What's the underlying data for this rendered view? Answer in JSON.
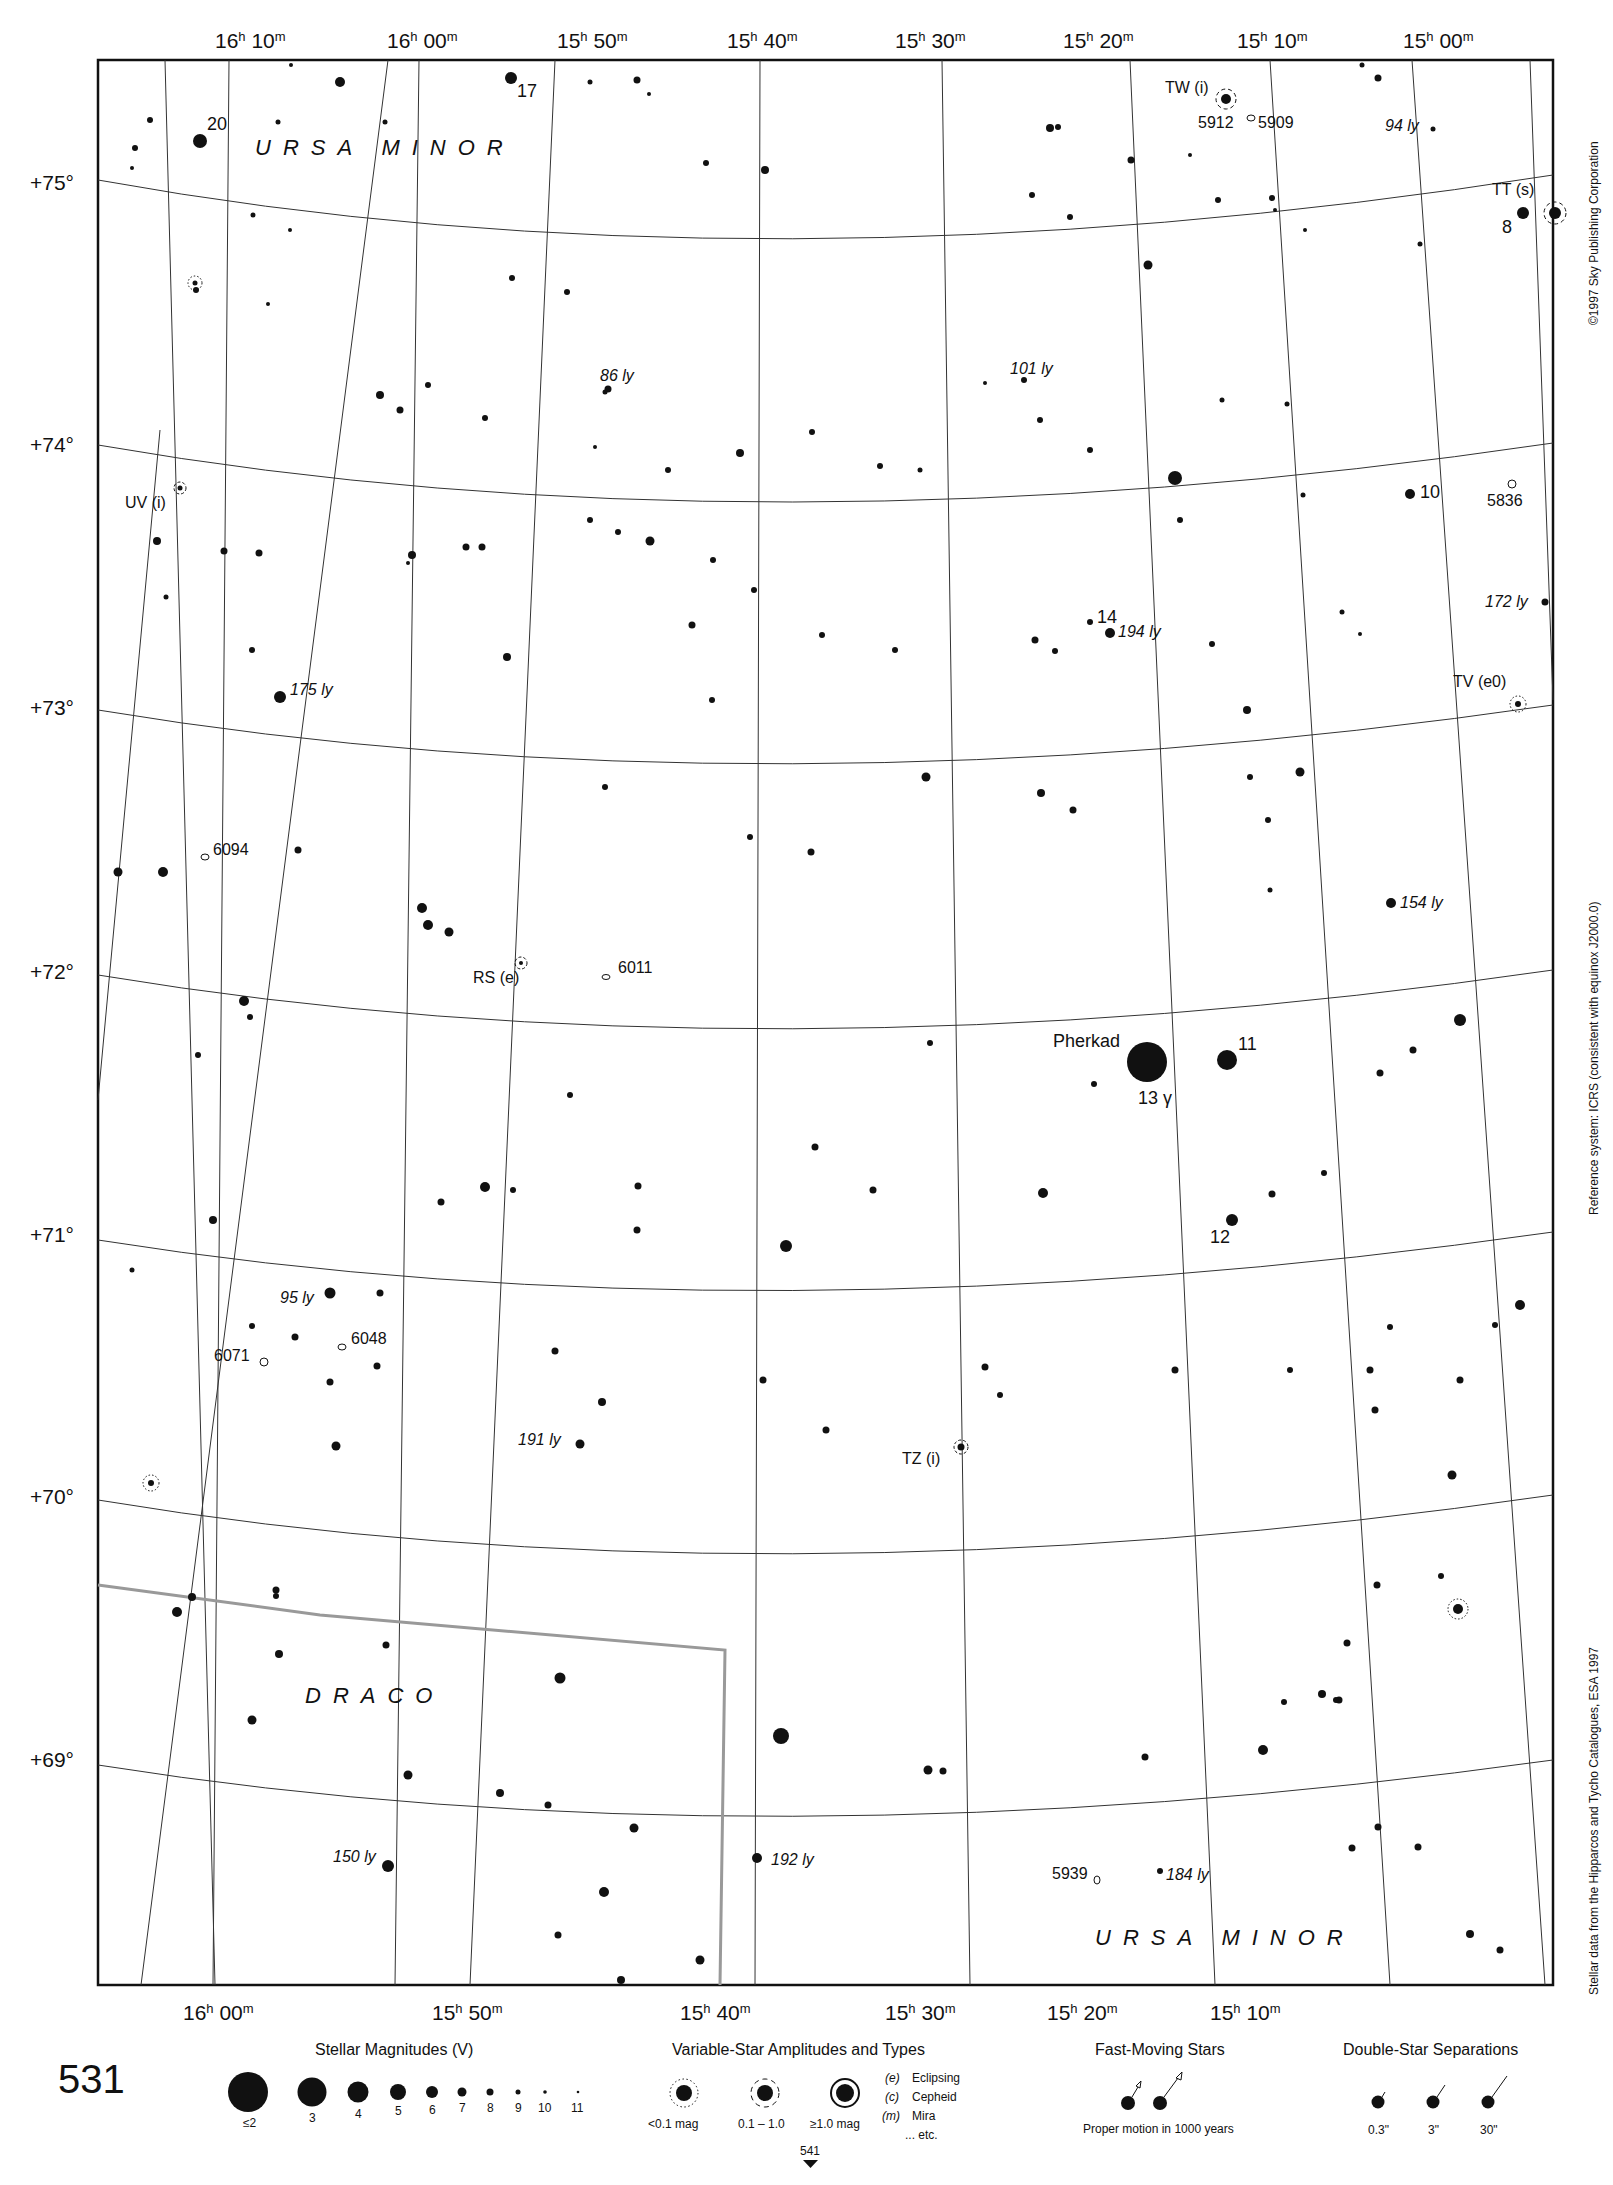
{
  "page": {
    "chart_number": "531",
    "next_chart_number": "541",
    "copyright": "©1997 Sky Publishing Corporation",
    "reference_system": "Reference system: ICRS (consistent with equinox J2000.0)",
    "data_source": "Stellar data from the Hipparcos and Tycho Catalogues, ESA 1997"
  },
  "axes": {
    "ra_top": [
      {
        "h": "16",
        "m": "10",
        "x": 200
      },
      {
        "h": "16",
        "m": "00",
        "x": 380
      },
      {
        "h": "15",
        "m": "50",
        "x": 560
      },
      {
        "h": "15",
        "m": "40",
        "x": 730
      },
      {
        "h": "15",
        "m": "30",
        "x": 900
      },
      {
        "h": "15",
        "m": "20",
        "x": 1070
      },
      {
        "h": "15",
        "m": "10",
        "x": 1240
      },
      {
        "h": "15",
        "m": "00",
        "x": 1405
      }
    ],
    "ra_bottom": [
      {
        "h": "16",
        "m": "00",
        "x": 180
      },
      {
        "h": "15",
        "m": "50",
        "x": 430
      },
      {
        "h": "15",
        "m": "40",
        "x": 680
      },
      {
        "h": "15",
        "m": "30",
        "x": 935
      },
      {
        "h": "15",
        "m": "20",
        "x": 1190
      },
      {
        "h": "15",
        "m": "10",
        "x": 1445
      }
    ],
    "dec": [
      {
        "label": "+75°",
        "y": 183
      },
      {
        "label": "+74°",
        "y": 445
      },
      {
        "label": "+73°",
        "y": 708
      },
      {
        "label": "+72°",
        "y": 972
      },
      {
        "label": "+71°",
        "y": 1235
      },
      {
        "label": "+70°",
        "y": 1497
      },
      {
        "label": "+69°",
        "y": 1760
      }
    ]
  },
  "constellations": [
    {
      "name": "URSA MINOR",
      "x": 255,
      "y": 155
    },
    {
      "name": "DRACO",
      "x": 305,
      "y": 1703
    },
    {
      "name": "URSA MINOR",
      "x": 1095,
      "y": 1945
    }
  ],
  "named_stars": [
    {
      "label": "Pherkad",
      "x": 1047,
      "y": 1042,
      "r": 19
    },
    {
      "label": "13 γ",
      "x": 1135,
      "y": 1100,
      "r": 0
    },
    {
      "label": "11",
      "x": 1230,
      "y": 1042,
      "r": 10
    },
    {
      "label": "12",
      "x": 1205,
      "y": 1238,
      "r": 6
    },
    {
      "label": "20",
      "x": 205,
      "y": 125,
      "r": 7
    },
    {
      "label": "17",
      "x": 512,
      "y": 92,
      "r": 6
    },
    {
      "label": "8",
      "x": 1505,
      "y": 225,
      "r": 6
    },
    {
      "label": "10",
      "x": 1412,
      "y": 492,
      "r": 5
    },
    {
      "label": "14",
      "x": 1097,
      "y": 618,
      "r": 5
    }
  ],
  "distance_labels": [
    {
      "label": "175 ly",
      "x": 287,
      "y": 685
    },
    {
      "label": "86 ly",
      "x": 600,
      "y": 375
    },
    {
      "label": "101 ly",
      "x": 1003,
      "y": 368
    },
    {
      "label": "194 ly",
      "x": 1108,
      "y": 630
    },
    {
      "label": "172 ly",
      "x": 1476,
      "y": 602
    },
    {
      "label": "94 ly",
      "x": 1380,
      "y": 128
    },
    {
      "label": "154 ly",
      "x": 1340,
      "y": 900
    },
    {
      "label": "95 ly",
      "x": 280,
      "y": 1298
    },
    {
      "label": "191 ly",
      "x": 515,
      "y": 1440
    },
    {
      "label": "150 ly",
      "x": 332,
      "y": 1858
    },
    {
      "label": "192 ly",
      "x": 770,
      "y": 1860
    },
    {
      "label": "184 ly",
      "x": 1165,
      "y": 1877
    }
  ],
  "variable_stars": [
    {
      "label": "TW (i)",
      "x": 1222,
      "y": 98
    },
    {
      "label": "TT (s)",
      "x": 1472,
      "y": 190
    },
    {
      "label": "UV (i)",
      "x": 140,
      "y": 505
    },
    {
      "label": "TV (e0)",
      "x": 1448,
      "y": 685
    },
    {
      "label": "RS (e)",
      "x": 473,
      "y": 980
    },
    {
      "label": "TZ (i)",
      "x": 900,
      "y": 1460
    }
  ],
  "deep_sky": [
    {
      "label": "5912",
      "x": 1195,
      "y": 125
    },
    {
      "label": "5909",
      "x": 1255,
      "y": 125
    },
    {
      "label": "5836",
      "x": 1482,
      "y": 502
    },
    {
      "label": "6094",
      "x": 213,
      "y": 850
    },
    {
      "label": "6011",
      "x": 617,
      "y": 970
    },
    {
      "label": "6048",
      "x": 350,
      "y": 1340
    },
    {
      "label": "6071",
      "x": 213,
      "y": 1356
    },
    {
      "label": "5939",
      "x": 1050,
      "y": 1875
    }
  ],
  "legend": {
    "magnitudes_title": "Stellar Magnitudes (V)",
    "magnitudes": [
      {
        "label": "≤2",
        "r": 19
      },
      {
        "label": "3",
        "r": 14
      },
      {
        "label": "4",
        "r": 10.5
      },
      {
        "label": "5",
        "r": 8
      },
      {
        "label": "6",
        "r": 6
      },
      {
        "label": "7",
        "r": 4.5
      },
      {
        "label": "8",
        "r": 3.5
      },
      {
        "label": "9",
        "r": 2.5
      },
      {
        "label": "10",
        "r": 1.8
      },
      {
        "label": "11",
        "r": 1.3
      }
    ],
    "variables_title": "Variable-Star Amplitudes and Types",
    "variables": [
      {
        "label": "<0.1 mag",
        "style": "dotted"
      },
      {
        "label": "0.1 – 1.0",
        "style": "dashed"
      },
      {
        "label": "≥1.0 mag",
        "style": "solid"
      }
    ],
    "var_types": [
      {
        "code": "(e)",
        "name": "Eclipsing"
      },
      {
        "code": "(c)",
        "name": "Cepheid"
      },
      {
        "code": "(m)",
        "name": "Mira"
      },
      {
        "code": "",
        "name": "... etc."
      }
    ],
    "fast_title": "Fast-Moving Stars",
    "fast_caption": "Proper motion in 1000 years",
    "double_title": "Double-Star Separations",
    "doubles": [
      "0.3\"",
      "3\"",
      "30\""
    ]
  },
  "colors": {
    "ink": "#111111",
    "paper": "#ffffff",
    "grid": "#333333",
    "boundary": "#999999"
  }
}
